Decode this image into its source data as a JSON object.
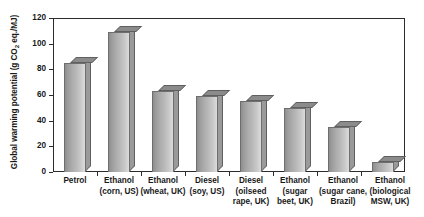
{
  "chart_data": {
    "type": "bar",
    "title": "",
    "xlabel": "",
    "ylabel": "Global warming potential (g CO2 eq./MJ)",
    "ylabel_parts": {
      "pre": "Global warming potential (g CO",
      "sub": "2",
      "post": " eq./MJ)"
    },
    "ylim": [
      0,
      120
    ],
    "yticks": [
      0,
      20,
      40,
      60,
      80,
      100,
      120
    ],
    "ytick_labels": [
      "0",
      "20",
      "40",
      "60",
      "80",
      "100",
      "120"
    ],
    "grid": false,
    "legend": false,
    "categories": [
      "Petrol",
      "Ethanol\n(corn, US)",
      "Ethanol\n(wheat, UK)",
      "Diesel\n(soy, US)",
      "Diesel\n(oilseed\nrape, UK)",
      "Ethanol\n(sugar\nbeet, UK)",
      "Ethanol\n(sugar cane,\nBrazil)",
      "Ethanol\n(biological\nMSW, UK)"
    ],
    "values": [
      85,
      109,
      63,
      59,
      55,
      50,
      35,
      8
    ],
    "bar_color": "#aeaeae",
    "bar_edge_color": "#6e6e6e",
    "axis_color": "#2b2b2b",
    "background_color": "#ffffff"
  }
}
